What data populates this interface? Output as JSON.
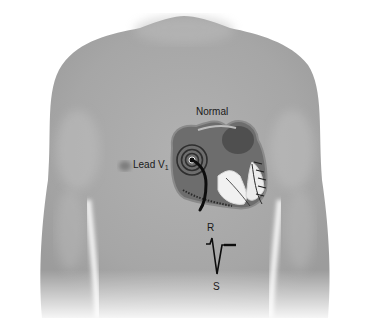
{
  "figure": {
    "labels": {
      "normal": "Normal",
      "lead": "Lead V",
      "lead_subscript": "1",
      "r_wave": "R",
      "s_wave": "S"
    },
    "colors": {
      "background": "#ffffff",
      "skin": "#a9a9a9",
      "skin_shade": "#8e8e8e",
      "heart_dark": "#5a5a5a",
      "heart_light": "#f2f2f2",
      "ink": "#111111"
    },
    "ecg_waveform": {
      "lead": "V1",
      "pattern": "rS",
      "components": [
        "small R wave",
        "deep S wave",
        "flat ST segment"
      ]
    }
  }
}
